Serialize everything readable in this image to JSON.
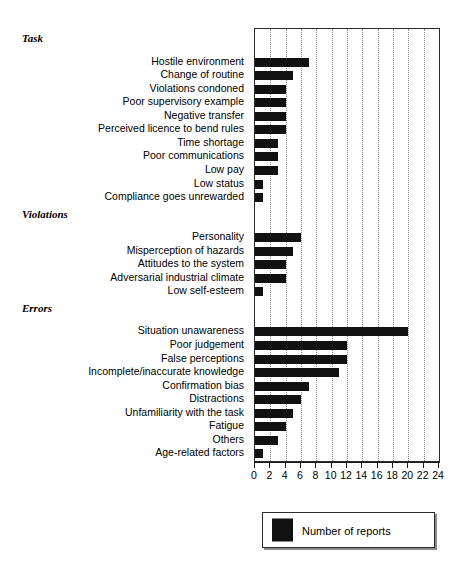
{
  "chart_data": {
    "type": "bar",
    "orientation": "horizontal",
    "title": "",
    "xlabel": "",
    "ylabel": "",
    "xlim": [
      0,
      24
    ],
    "xticks": [
      0,
      2,
      4,
      6,
      8,
      10,
      12,
      14,
      16,
      18,
      20,
      22,
      24
    ],
    "xtick_labels": [
      "0",
      "2",
      "4",
      "6",
      "8",
      "10",
      "12",
      "14",
      "16",
      "18",
      "20",
      "22",
      "24"
    ],
    "grid": true,
    "grid_axis": "x",
    "grid_style": "dotted",
    "legend": {
      "position": "bottom-right",
      "entries": [
        {
          "label": "Number of reports",
          "color": "#111111"
        }
      ]
    },
    "bar_color": "#111111",
    "groups": [
      {
        "name": "Task",
        "categories": [
          "Hostile environment",
          "Change of routine",
          "Violations condoned",
          "Poor supervisory example",
          "Negative transfer",
          "Perceived licence to bend rules",
          "Time shortage",
          "Poor communications",
          "Low pay",
          "Low status",
          "Compliance goes unrewarded"
        ],
        "values": [
          7,
          5,
          4,
          4,
          4,
          4,
          3,
          3,
          3,
          1,
          1
        ]
      },
      {
        "name": "Violations",
        "categories": [
          "Personality",
          "Misperception of hazards",
          "Attitudes to the system",
          "Adversarial industrial climate",
          "Low self-esteem"
        ],
        "values": [
          6,
          5,
          4,
          4,
          1
        ]
      },
      {
        "name": "Errors",
        "categories": [
          "Situation unawareness",
          "Poor judgement",
          "False perceptions",
          "Incomplete/inaccurate knowledge",
          "Confirmation bias",
          "Distractions",
          "Unfamiliarity with the task",
          "Fatigue",
          "Others",
          "Age-related factors"
        ],
        "values": [
          20,
          12,
          12,
          11,
          7,
          6,
          5,
          4,
          3,
          1
        ]
      }
    ]
  }
}
